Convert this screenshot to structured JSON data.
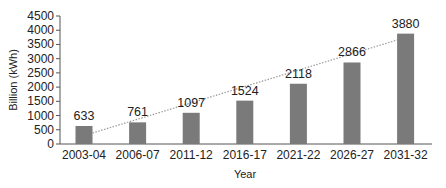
{
  "chart_data": {
    "type": "bar",
    "title": "",
    "xlabel": "Year",
    "ylabel": "Billion (kWh)",
    "categories": [
      "2003-04",
      "2006-07",
      "2011-12",
      "2016-17",
      "2021-22",
      "2026-27",
      "2031-32"
    ],
    "values": [
      633,
      761,
      1097,
      1524,
      2118,
      2866,
      3880
    ],
    "data_labels": [
      "633",
      "761",
      "1097",
      "1524",
      "2118",
      "2866",
      "3880"
    ],
    "ylim": [
      0,
      4500
    ],
    "yticks": [
      0,
      500,
      1000,
      1500,
      2000,
      2500,
      3000,
      3500,
      4000,
      4500
    ],
    "grid": false,
    "legend": null,
    "trendline": {
      "style": "dotted",
      "type": "linear",
      "from_category": "2003-04",
      "to_category": "2031-32"
    },
    "colors": {
      "bar": "#7a7a7a",
      "trendline": "#9a9a9a",
      "axis": "#555555"
    }
  }
}
